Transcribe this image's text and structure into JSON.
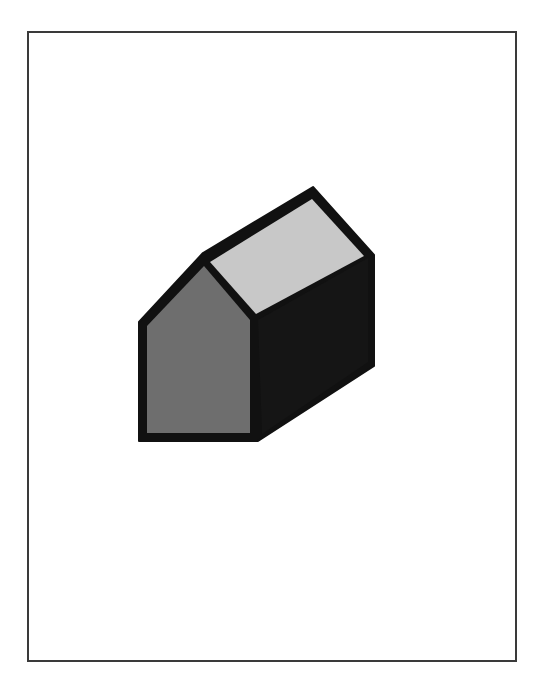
{
  "figure": {
    "colors": {
      "outline": "#111111",
      "front_face": "#6e6e6e",
      "roof_face": "#c8c8c8",
      "side_face": "#151515",
      "frame": "#3a3a3a",
      "background": "#ffffff"
    },
    "faces": [
      {
        "name": "front-gable-face",
        "shade": "medium gray"
      },
      {
        "name": "roof-face",
        "shade": "light gray"
      },
      {
        "name": "side-wall-face",
        "shade": "black"
      }
    ]
  }
}
